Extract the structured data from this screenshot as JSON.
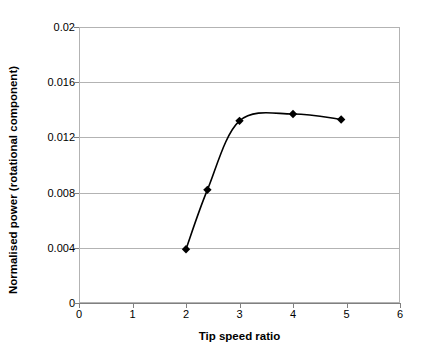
{
  "chart_data": {
    "type": "line",
    "title": "",
    "xlabel": "Tip speed ratio",
    "ylabel": "Normalised power (rotational component)",
    "xlim": [
      0,
      6
    ],
    "ylim": [
      0,
      0.02
    ],
    "xticks": [
      "0",
      "1",
      "2",
      "3",
      "4",
      "5",
      "6"
    ],
    "yticks": [
      "0",
      "0.004",
      "0.008",
      "0.012",
      "0.016",
      "0.02"
    ],
    "xtick_values": [
      0,
      1,
      2,
      3,
      4,
      5,
      6
    ],
    "ytick_values": [
      0,
      0.004,
      0.008,
      0.012,
      0.016,
      0.02
    ],
    "grid": "horizontal",
    "legend": "none",
    "marker": "diamond",
    "line_color": "#000000",
    "marker_color": "#000000",
    "grid_color": "#b3b3b3",
    "background": "#ffffff",
    "series": [
      {
        "name": "Normalised power (rotational component)",
        "x": [
          2.0,
          2.4,
          3.0,
          4.0,
          4.9
        ],
        "values": [
          0.0039,
          0.0082,
          0.0132,
          0.0137,
          0.0133
        ]
      }
    ]
  }
}
